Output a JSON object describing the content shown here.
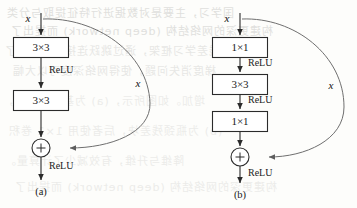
{
  "figure": {
    "caption_a": "(a)",
    "caption_b": "(b)",
    "input_label": "x",
    "skip_label": "x",
    "activation_label": "ReLU",
    "plus_symbol": "+",
    "colors": {
      "page_background": "#fdfdfb",
      "ink": "#2b2b2b",
      "skip_curve": "#6f6f6f",
      "bleed_text": "#c9c9c6"
    }
  },
  "block_a": {
    "name": "basic-residual-block",
    "caption": "(a)",
    "input_label": "x",
    "skip_label": "x",
    "boxes": [
      {
        "label": "3×3"
      },
      {
        "label": "3×3"
      }
    ],
    "activations": [
      "ReLU",
      "ReLU"
    ],
    "sum_symbol": "+"
  },
  "block_b": {
    "name": "bottleneck-residual-block",
    "caption": "(b)",
    "input_label": "x",
    "skip_label": "x",
    "boxes": [
      {
        "label": "1×1"
      },
      {
        "label": "3×3"
      },
      {
        "label": "1×1"
      }
    ],
    "activations": [
      "ReLU",
      "ReLU",
      "ReLU"
    ],
    "sum_symbol": "+"
  },
  "bleed_through": {
    "lines": [
      "国学习，主要是对数据进行特征提取与分类",
      "构建更深的网络结构 (deep network) 而提出了",
      "残差学习框架，通过跳跃连接有效缓解了",
      "梯度消失问题，使得网络深度可以大幅",
      "增加。如图所示，(a) 为基本残差块，",
      "(b) 为瓶颈残差块，后者使用 1×1 卷积",
      "降维与升维，有效减少了计算量。"
    ]
  }
}
